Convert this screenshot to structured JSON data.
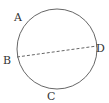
{
  "figure": {
    "type": "circle-with-chord",
    "circle": {
      "cx": 57,
      "cy": 49,
      "r": 40,
      "stroke": "#555555"
    },
    "chord": {
      "from": "B",
      "to": "D",
      "style": "dashed",
      "stroke": "#555555"
    },
    "points": [
      {
        "label": "A",
        "x": 17,
        "y": 18
      },
      {
        "label": "B",
        "x": 8,
        "y": 61
      },
      {
        "label": "C",
        "x": 52,
        "y": 99
      },
      {
        "label": "D",
        "x": 98,
        "y": 50
      }
    ]
  }
}
